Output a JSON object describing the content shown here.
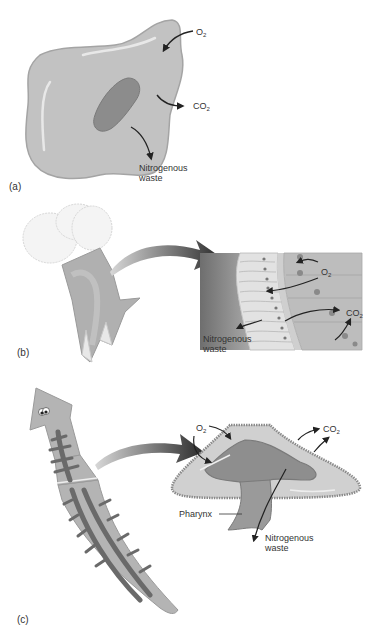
{
  "figure": {
    "panels": [
      {
        "id": "a",
        "panel_label": "(a)",
        "subject": "single-celled organism (amoeba)",
        "labels": {
          "o2": {
            "base": "O",
            "sub": "2"
          },
          "co2": {
            "base": "CO",
            "sub": "2"
          },
          "waste_line1": "Nitrogenous",
          "waste_line2": "waste"
        }
      },
      {
        "id": "b",
        "panel_label": "(b)",
        "subject": "hydra / cnidarian with enlarged cell layer",
        "labels": {
          "o2": {
            "base": "O",
            "sub": "2"
          },
          "co2": {
            "base": "CO",
            "sub": "2"
          },
          "waste_line1": "Nitrogenous",
          "waste_line2": "waste"
        }
      },
      {
        "id": "c",
        "panel_label": "(c)",
        "subject": "flatworm (planarian) with cross-section",
        "labels": {
          "o2": {
            "base": "O",
            "sub": "2"
          },
          "co2": {
            "base": "CO",
            "sub": "2"
          },
          "pharynx": "Pharynx",
          "waste_line1": "Nitrogenous",
          "waste_line2": "waste"
        }
      }
    ],
    "colors": {
      "cell_fill": "#c2c2c2",
      "cell_edge": "#9a9a9a",
      "nucleus": "#8c8c8c",
      "arrow_dark": "#2a2a2a",
      "tissue_light": "#dcdcdc",
      "tissue_mid": "#a8a8a8",
      "tissue_dark": "#7a7a7a",
      "text": "#333333"
    }
  }
}
